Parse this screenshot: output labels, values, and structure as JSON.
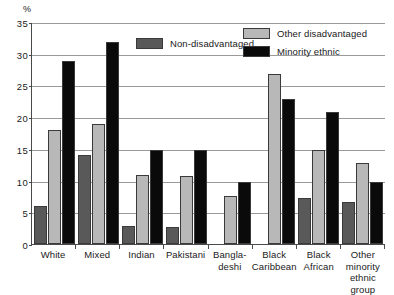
{
  "chart_data": {
    "type": "bar",
    "title": "",
    "subtitle": "",
    "xlabel": "",
    "ylabel": "%",
    "ylim": [
      0,
      35
    ],
    "yticks": [
      0,
      5,
      10,
      15,
      20,
      25,
      30,
      35
    ],
    "grid": true,
    "legend_position": "top-right",
    "categories": [
      "White",
      "Mixed",
      "Indian",
      "Pakistani",
      "Bangla-\ndeshi",
      "Black\nCaribbean",
      "Black\nAfrican",
      "Other\nminority\nethnic group"
    ],
    "series": [
      {
        "name": "Non-disadvantaged",
        "color": "#595959",
        "values": [
          6,
          14,
          2.8,
          2.7,
          null,
          null,
          7.2,
          6.6
        ]
      },
      {
        "name": "Other disadvantaged",
        "color": "#b8b8b8",
        "values": [
          17.9,
          19,
          10.9,
          10.8,
          7.6,
          26.8,
          14.9,
          12.8
        ]
      },
      {
        "name": "Minority ethnic",
        "color": "#0a0a0a",
        "values": [
          28.9,
          31.9,
          14.9,
          14.9,
          9.8,
          22.9,
          20.8,
          9.8
        ]
      }
    ]
  },
  "axis": {
    "unit_label": "%",
    "tick_labels": [
      "0",
      "5",
      "10",
      "15",
      "20",
      "25",
      "30",
      "35"
    ]
  },
  "legend": {
    "items": [
      {
        "label": "Non-disadvantaged",
        "color": "#595959"
      },
      {
        "label": "Other disadvantaged",
        "color": "#b8b8b8"
      },
      {
        "label": "Minority ethnic",
        "color": "#0a0a0a"
      }
    ]
  }
}
